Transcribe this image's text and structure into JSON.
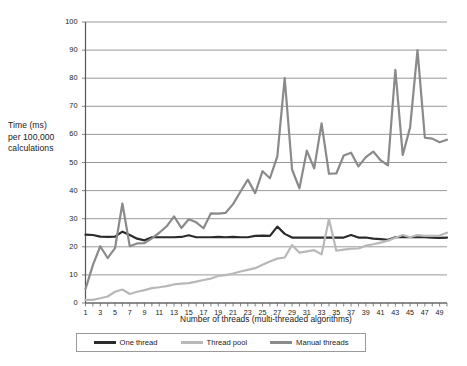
{
  "chart_data": {
    "type": "line",
    "title": "",
    "xlabel": "Number of threads (multi-threaded algorithms)",
    "ylabel": "Time (ms) per 100,000 calculations",
    "ylabel_lines": [
      "Time (ms)",
      "per 100,000",
      "calculations"
    ],
    "xlim": [
      1,
      50
    ],
    "ylim": [
      0,
      100
    ],
    "grid": true,
    "legend_position": "bottom",
    "y_ticks": [
      0,
      10,
      20,
      30,
      40,
      50,
      60,
      70,
      80,
      90,
      100
    ],
    "x_ticks": [
      1,
      3,
      5,
      7,
      9,
      11,
      13,
      15,
      17,
      19,
      21,
      23,
      25,
      27,
      29,
      31,
      33,
      35,
      37,
      39,
      41,
      43,
      45,
      47,
      49
    ],
    "x": [
      1,
      2,
      3,
      4,
      5,
      6,
      7,
      8,
      9,
      10,
      11,
      12,
      13,
      14,
      15,
      16,
      17,
      18,
      19,
      20,
      21,
      22,
      23,
      24,
      25,
      26,
      27,
      28,
      29,
      30,
      31,
      32,
      33,
      34,
      35,
      36,
      37,
      38,
      39,
      40,
      41,
      42,
      43,
      44,
      45,
      46,
      47,
      48,
      49,
      50
    ],
    "series": [
      {
        "name": "One thread",
        "color": "#2b2b2b",
        "width": 2.2,
        "values": [
          24.3,
          24.2,
          23.6,
          23.5,
          23.6,
          25.4,
          24.2,
          22.9,
          22.3,
          23.4,
          23.4,
          23.4,
          23.4,
          23.5,
          24.1,
          23.4,
          23.4,
          23.4,
          23.5,
          23.4,
          23.5,
          23.4,
          23.4,
          23.9,
          24.0,
          23.9,
          27.2,
          24.6,
          23.3,
          23.3,
          23.3,
          23.3,
          23.3,
          23.3,
          23.3,
          23.3,
          24.2,
          23.3,
          23.3,
          22.9,
          22.7,
          22.5,
          23.4,
          23.5,
          23.4,
          23.4,
          23.4,
          23.3,
          23.2,
          23.3
        ]
      },
      {
        "name": "Thread pool",
        "color": "#b8b8b8",
        "width": 2.2,
        "values": [
          1.1,
          1.1,
          1.7,
          2.3,
          4.0,
          4.8,
          3.2,
          4.0,
          4.6,
          5.3,
          5.6,
          6.0,
          6.6,
          6.9,
          7.1,
          7.6,
          8.2,
          8.7,
          9.6,
          9.9,
          10.5,
          11.2,
          11.8,
          12.4,
          13.6,
          14.8,
          15.8,
          16.2,
          20.6,
          17.9,
          18.4,
          18.8,
          17.3,
          29.9,
          18.6,
          19.0,
          19.3,
          19.4,
          20.4,
          20.9,
          21.5,
          22.2,
          23.2,
          24.2,
          23.4,
          24.2,
          23.9,
          23.9,
          24.0,
          25.0
        ]
      },
      {
        "name": "Manual threads",
        "color": "#8a8a8a",
        "width": 2.2,
        "values": [
          5.0,
          13.5,
          20.2,
          16.0,
          19.5,
          35.4,
          20.2,
          21.2,
          21.3,
          23.0,
          25.0,
          27.3,
          30.8,
          26.7,
          29.8,
          28.7,
          26.6,
          31.9,
          31.8,
          32.1,
          35.2,
          39.6,
          43.9,
          39.1,
          46.9,
          44.4,
          52.2,
          80.0,
          47.5,
          40.8,
          54.2,
          47.9,
          63.9,
          46.0,
          46.1,
          52.5,
          53.5,
          48.6,
          51.9,
          53.9,
          50.8,
          49.0,
          83.0,
          52.7,
          62.5,
          90.0,
          58.8,
          58.5,
          57.2,
          58.1
        ]
      }
    ]
  },
  "legend": {
    "items": [
      {
        "label": "One thread"
      },
      {
        "label": "Thread pool"
      },
      {
        "label": "Manual threads"
      }
    ]
  }
}
